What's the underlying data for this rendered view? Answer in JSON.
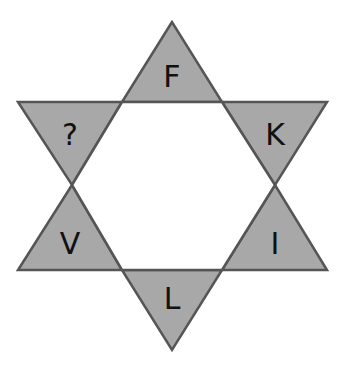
{
  "puzzle": {
    "shape": "six-pointed star",
    "fill_color": "#a8a8a8",
    "stroke_color": "#555555",
    "points": [
      {
        "position": "top",
        "label": "F"
      },
      {
        "position": "upper-right",
        "label": "K"
      },
      {
        "position": "lower-right",
        "label": "I"
      },
      {
        "position": "bottom",
        "label": "L"
      },
      {
        "position": "lower-left",
        "label": "V"
      },
      {
        "position": "upper-left",
        "label": "?"
      }
    ]
  }
}
